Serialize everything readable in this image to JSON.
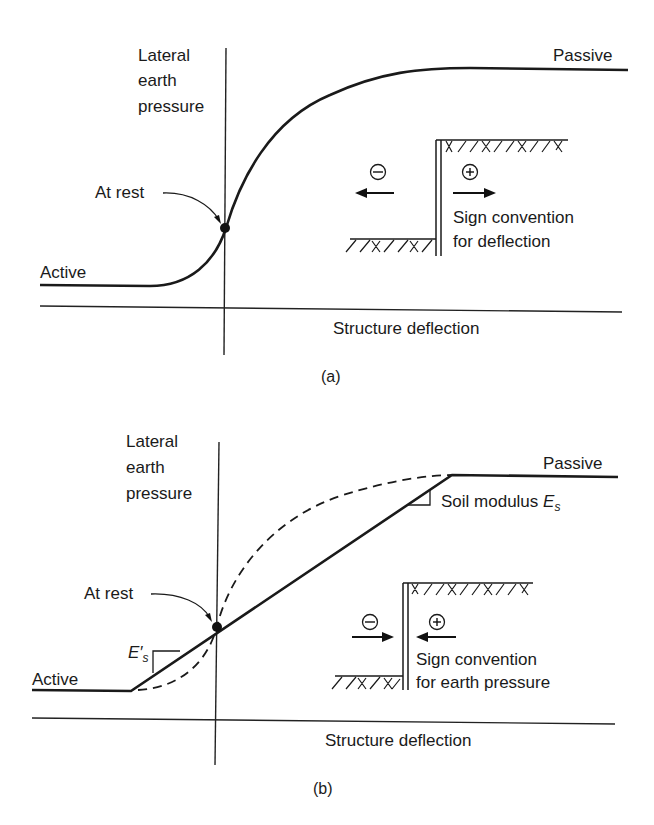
{
  "figure": {
    "panel_a": {
      "caption": "(a)",
      "y_axis_label_lines": [
        "Lateral",
        "earth",
        "pressure"
      ],
      "x_axis_label": "Structure deflection",
      "curve_labels": {
        "passive": "Passive",
        "active": "Active",
        "at_rest": "At rest"
      },
      "inset": {
        "minus_symbol": "−",
        "plus_symbol": "+",
        "caption_lines": [
          "Sign convention",
          "for deflection"
        ],
        "minus_arrow_direction": "left",
        "plus_arrow_direction": "right"
      },
      "curve_style": "smooth S-curve (solid)"
    },
    "panel_b": {
      "caption": "(b)",
      "y_axis_label_lines": [
        "Lateral",
        "earth",
        "pressure"
      ],
      "x_axis_label": "Structure deflection",
      "curve_labels": {
        "passive": "Passive",
        "active": "Active",
        "at_rest": "At rest"
      },
      "slope_labels": {
        "upper": "Soil modulus ",
        "upper_symbol": "E",
        "upper_subscript": "s",
        "lower_symbol": "E′",
        "lower_subscript": "s"
      },
      "inset": {
        "minus_symbol": "−",
        "plus_symbol": "+",
        "caption_lines": [
          "Sign convention",
          "for earth pressure"
        ],
        "minus_arrow_direction": "right",
        "plus_arrow_direction": "left"
      },
      "curve_style": "bilinear solid with dashed nonlinear reference"
    }
  }
}
